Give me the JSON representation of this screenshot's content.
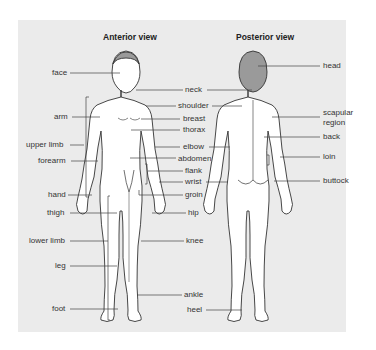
{
  "diagram": {
    "type": "anatomical body regions",
    "colors": {
      "panel_bg": "#ebebeb",
      "body_fill": "#ffffff",
      "outline": "#333333",
      "head_shade": "#9a9a9a",
      "leader": "#444444"
    },
    "anterior": {
      "title": "Anterior view",
      "left_labels": [
        {
          "text": "face",
          "x": 52,
          "y": 72,
          "tx": 118
        },
        {
          "text": "arm",
          "x": 62,
          "y": 117,
          "tx": 100
        },
        {
          "text": "upper limb",
          "x": 26,
          "y": 145,
          "tx": 84
        },
        {
          "text": "forearm",
          "x": 43,
          "y": 161,
          "tx": 98
        },
        {
          "text": "hand",
          "x": 47,
          "y": 195,
          "tx": 93
        },
        {
          "text": "thigh",
          "x": 48,
          "y": 212,
          "tx": 117
        },
        {
          "text": "lower limb",
          "x": 29,
          "y": 240,
          "tx": 108
        },
        {
          "text": "leg",
          "x": 56,
          "y": 266,
          "tx": 117
        },
        {
          "text": "foot",
          "x": 53,
          "y": 308,
          "tx": 118
        }
      ],
      "center_labels": [
        {
          "text": "neck",
          "x": 186,
          "y": 89
        },
        {
          "text": "shoulder",
          "x": 179,
          "y": 105
        },
        {
          "text": "breast",
          "x": 183,
          "y": 118
        },
        {
          "text": "thorax",
          "x": 183,
          "y": 129
        },
        {
          "text": "elbow",
          "x": 183,
          "y": 146
        },
        {
          "text": "abdomen",
          "x": 178,
          "y": 158
        },
        {
          "text": "flank",
          "x": 186,
          "y": 170
        },
        {
          "text": "wrist",
          "x": 186,
          "y": 181
        },
        {
          "text": "groin",
          "x": 186,
          "y": 194
        },
        {
          "text": "hip",
          "x": 189,
          "y": 212
        },
        {
          "text": "knee",
          "x": 187,
          "y": 240
        },
        {
          "text": "ankle",
          "x": 185,
          "y": 294
        },
        {
          "text": "heel",
          "x": 188,
          "y": 309
        }
      ]
    },
    "posterior": {
      "title": "Posterior view",
      "right_labels": [
        {
          "text": "head",
          "x": 323,
          "y": 66
        },
        {
          "text": "scapular",
          "x": 323,
          "y": 113
        },
        {
          "text": "region",
          "x": 323,
          "y": 123
        },
        {
          "text": "back",
          "x": 323,
          "y": 136
        },
        {
          "text": "loin",
          "x": 323,
          "y": 157
        },
        {
          "text": "buttock",
          "x": 323,
          "y": 181
        }
      ]
    }
  }
}
